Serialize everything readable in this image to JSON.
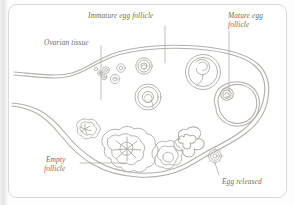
{
  "figure": {
    "kind": "anatomical-diagram",
    "style": "pencil-line-drawing",
    "stroke_color": "#b3b0ac",
    "label_color": "#6f6c68",
    "background_color": "#ffffff",
    "frame_color": "#d9d9d9"
  },
  "labels": {
    "immature": "Immature egg follicle",
    "mature": "Mature egg\nfollicle",
    "ovarian": "Ovarian tissue",
    "empty": "Empty\nfollicle",
    "egg_released": "Egg released"
  },
  "structures": [
    {
      "name": "ovarian-tissue-outline",
      "description": "double-line ovary body with tapering ligament tails at left"
    },
    {
      "name": "primordial-follicle-cluster",
      "description": "small circles at upper left of ovary interior"
    },
    {
      "name": "immature-follicle",
      "description": "concentric ringed follicles growing in size"
    },
    {
      "name": "mature-follicle",
      "description": "large antral follicle with egg at upper left"
    },
    {
      "name": "ruptured-follicle",
      "description": "scalloped opening at lower right where egg escapes"
    },
    {
      "name": "corpus-luteum",
      "description": "lobed follicle remnants with star-shaped centers"
    },
    {
      "name": "released-egg",
      "description": "small circle with radiating corona outside the ovary"
    }
  ]
}
